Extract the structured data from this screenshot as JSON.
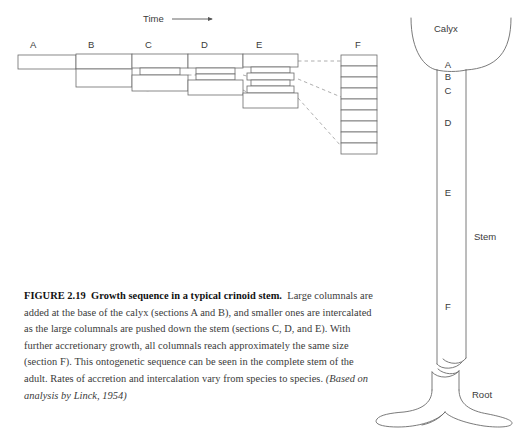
{
  "figure": {
    "number": "FIGURE 2.19",
    "title": "Growth sequence in a typical crinoid stem.",
    "body": "Large columnals are added at the base of the calyx (sections A and B), and smaller ones are intercalated as the large columnals are pushed down the stem (sections C, D, and E). With further accretionary growth, all columnals reach approximately the same size (section F). This ontogenetic sequence can be seen in the complete stem of the adult. Rates of accretion and intercalation vary from species to species.",
    "source": "(Based on analysis by Linck, 1954)"
  },
  "diagram": {
    "time_label": "Time",
    "time_arrow": "⟶",
    "sections": [
      {
        "id": "A",
        "label": "A",
        "large_columnals": 1,
        "small_columnals": 0
      },
      {
        "id": "B",
        "label": "B",
        "large_columnals": 2,
        "small_columnals": 0
      },
      {
        "id": "C",
        "label": "C",
        "large_columnals": 2,
        "small_columnals": 1
      },
      {
        "id": "D",
        "label": "D",
        "large_columnals": 2,
        "small_columnals": 2
      },
      {
        "id": "E",
        "label": "E",
        "large_columnals": 2,
        "small_columnals": 4
      },
      {
        "id": "F",
        "label": "F",
        "large_columnals": 9,
        "small_columnals": 0
      }
    ]
  },
  "crinoid": {
    "calyx_label": "Calyx",
    "stem_label": "Stem",
    "root_label": "Root",
    "stem_marks": [
      "A",
      "B",
      "C",
      "D",
      "E",
      "F"
    ]
  },
  "colors": {
    "stroke": "#6b6b6b",
    "dashed": "#9a9a9a",
    "text": "#333333",
    "caption": "#2b2b2b"
  }
}
